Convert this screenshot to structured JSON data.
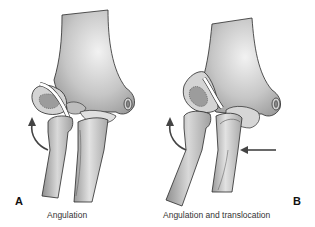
{
  "figure": {
    "panels": [
      {
        "letter": "A",
        "caption": "Angulation"
      },
      {
        "letter": "B",
        "caption": "Angulation and translocation"
      }
    ],
    "colors": {
      "bone_light": "#e8e8e8",
      "bone_mid": "#bdbdbd",
      "bone_dark": "#8c8c8c",
      "outline": "#2a2a2a",
      "arrow": "#444444",
      "background": "#ffffff"
    }
  }
}
